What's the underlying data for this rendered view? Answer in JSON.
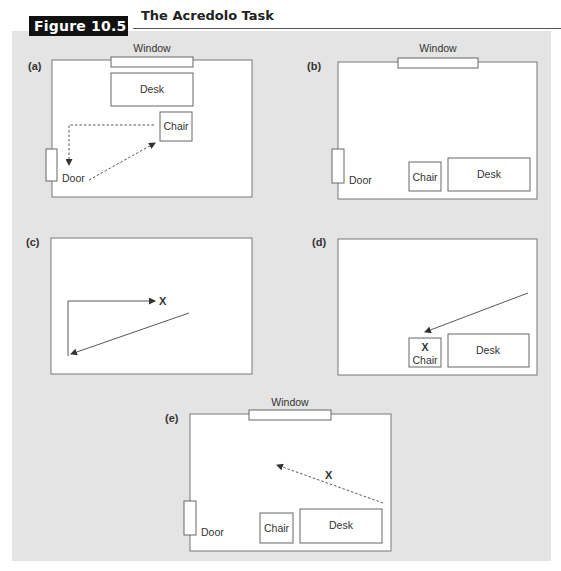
{
  "figure": {
    "label": "Figure 10.5",
    "title": "The Acredolo Task"
  },
  "labels": {
    "window": "Window",
    "desk": "Desk",
    "chair": "Chair",
    "door": "Door",
    "target": "X"
  },
  "panels": [
    {
      "id": "a",
      "tag": "(a)",
      "has_window": true,
      "has_door": true,
      "furniture": [
        "Desk",
        "Chair"
      ],
      "path": "dashed L-route from chair past door, then diagonal back to chair"
    },
    {
      "id": "b",
      "tag": "(b)",
      "has_window": true,
      "has_door": true,
      "furniture": [
        "Chair",
        "Desk"
      ]
    },
    {
      "id": "c",
      "tag": "(c)",
      "has_window": false,
      "has_door": false,
      "furniture": [],
      "path": "solid L-route to X, diagonal back"
    },
    {
      "id": "d",
      "tag": "(d)",
      "has_window": false,
      "has_door": false,
      "furniture": [
        "Chair with X",
        "Desk"
      ],
      "path": "diagonal arrow toward chair"
    },
    {
      "id": "e",
      "tag": "(e)",
      "has_window": true,
      "has_door": true,
      "furniture": [
        "Chair",
        "Desk"
      ],
      "path": "dashed diagonal arrow passing X"
    }
  ],
  "colors": {
    "background_panel": "#e4e4e4",
    "label_block": "#111111",
    "room_stroke": "#777777",
    "line": "#444444"
  }
}
